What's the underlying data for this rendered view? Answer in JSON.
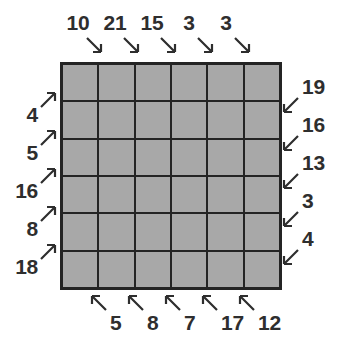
{
  "theme": {
    "cell_gray": "#a8a8a8",
    "line_dark": "#242424",
    "text_dark": "#2e2e2e",
    "background": "#ffffff"
  },
  "puzzle": {
    "grid": {
      "rows": 6,
      "cols": 6
    },
    "clues": {
      "top": [
        10,
        21,
        15,
        3,
        3
      ],
      "right": [
        19,
        16,
        13,
        3,
        4
      ],
      "bottom": [
        5,
        8,
        7,
        17,
        12
      ],
      "left": [
        4,
        5,
        16,
        8,
        18
      ]
    },
    "arrow_directions": {
      "top": "southeast",
      "right": "southwest",
      "bottom": "northwest",
      "left": "northeast"
    }
  }
}
